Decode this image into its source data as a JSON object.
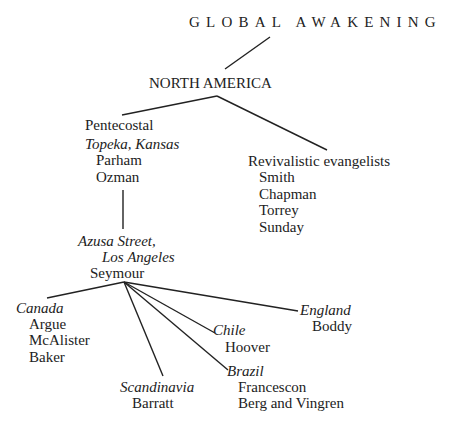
{
  "title": "GLOBAL AWAKENING",
  "region": "NORTH AMERICA",
  "pentecostal": {
    "label": "Pentecostal",
    "place": "Topeka, Kansas",
    "people": [
      "Parham",
      "Ozman"
    ]
  },
  "revivalistic": {
    "label": "Revivalistic evangelists",
    "people": [
      "Smith",
      "Chapman",
      "Torrey",
      "Sunday"
    ]
  },
  "azusa": {
    "place_line1": "Azusa Street,",
    "place_line2": "Los Angeles",
    "person": "Seymour"
  },
  "branches": {
    "canada": {
      "place": "Canada",
      "people": [
        "Argue",
        "McAlister",
        "Baker"
      ]
    },
    "scandinavia": {
      "place": "Scandinavia",
      "people": [
        "Barratt"
      ]
    },
    "chile": {
      "place": "Chile",
      "people": [
        "Hoover"
      ]
    },
    "brazil": {
      "place": "Brazil",
      "people": [
        "Francescon",
        "Berg and Vingren"
      ]
    },
    "england": {
      "place": "England",
      "people": [
        "Boddy"
      ]
    }
  }
}
